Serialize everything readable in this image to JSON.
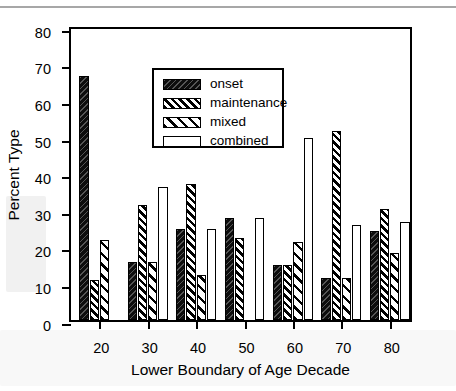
{
  "page": {
    "header_ghost": ""
  },
  "chart_data": {
    "type": "bar",
    "title": "",
    "subtitle": "",
    "xlabel": "Lower Boundary of Age Decade",
    "ylabel": "Percent Type",
    "categories": [
      "20",
      "30",
      "40",
      "50",
      "60",
      "70",
      "80"
    ],
    "ylim": [
      0,
      80
    ],
    "yticks": [
      "0",
      "10",
      "20",
      "30",
      "40",
      "50",
      "60",
      "70",
      "80"
    ],
    "grid": false,
    "legend_position": "top-left-inside",
    "series": [
      {
        "name": "onset",
        "pattern": "solid-black",
        "values": [
          67,
          16,
          25,
          28,
          15,
          11.5,
          24.5
        ]
      },
      {
        "name": "maintenance",
        "pattern": "dense-diagonal-hatch",
        "values": [
          11,
          31.5,
          37.5,
          22.5,
          15,
          52,
          30.5
        ]
      },
      {
        "name": "mixed",
        "pattern": "wide-diagonal-hatch",
        "values": [
          22,
          16,
          12.5,
          0,
          21.5,
          11.5,
          18.5
        ]
      },
      {
        "name": "combined",
        "pattern": "open-white",
        "values": [
          0,
          36.5,
          25,
          28,
          50,
          26,
          27
        ]
      }
    ]
  }
}
